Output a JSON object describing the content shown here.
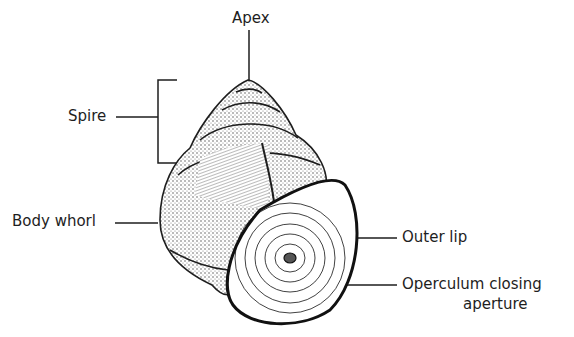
{
  "diagram": {
    "labels": {
      "apex": "Apex",
      "spire": "Spire",
      "body_whorl": "Body whorl",
      "outer_lip": "Outer lip",
      "operculum_line1": "Operculum closing",
      "operculum_line2": "aperture"
    },
    "colors": {
      "ink": "#1e1e1e",
      "background": "#ffffff"
    }
  }
}
